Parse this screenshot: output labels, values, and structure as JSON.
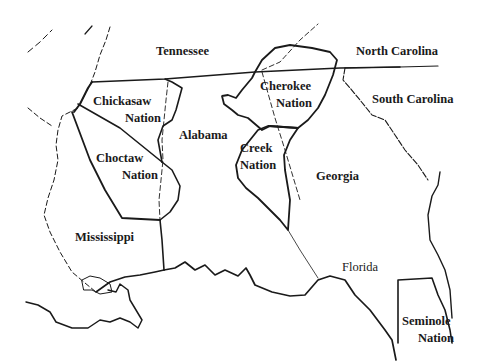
{
  "map": {
    "states": {
      "tennessee": "Tennessee",
      "north_carolina": "North Carolina",
      "south_carolina": "South Carolina",
      "alabama": "Alabama",
      "georgia": "Georgia",
      "mississippi": "Mississippi",
      "florida": "Florida"
    },
    "nations": {
      "chickasaw": {
        "line1": "Chickasaw",
        "line2": "Nation"
      },
      "choctaw": {
        "line1": "Choctaw",
        "line2": "Nation"
      },
      "cherokee": {
        "line1": "Cherokee",
        "line2": "Nation"
      },
      "creek": {
        "line1": "Creek",
        "line2": "Nation"
      },
      "seminole": {
        "line1": "Seminole",
        "line2": "Nation"
      }
    },
    "colors": {
      "ink": "#1a1a1a",
      "background": "#ffffff"
    }
  }
}
